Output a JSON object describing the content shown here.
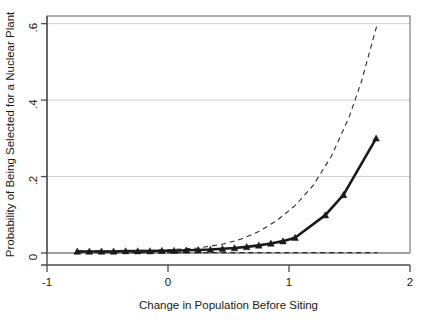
{
  "chart_data": {
    "type": "line",
    "title": "",
    "subtitle": "",
    "xlabel": "Change in Population Before Siting",
    "ylabel": "Probability of Being Selected for a Nuclear Plant",
    "annotation": "N = 188",
    "xlim": [
      -1,
      2
    ],
    "ylim": [
      0,
      0.62
    ],
    "xticks": [
      -1,
      0,
      1,
      2
    ],
    "xtick_labels": [
      "-1",
      "0",
      "1",
      "2"
    ],
    "yticks": [
      0,
      0.2,
      0.4,
      0.6
    ],
    "ytick_labels": [
      "0",
      ".2",
      ".4",
      ".6"
    ],
    "grid": "horizontal",
    "legend": "none",
    "series": [
      {
        "name": "Predicted probability",
        "style": "solid",
        "marker": "triangle",
        "color": "#1a1a1a",
        "width": 2.6,
        "x": [
          -0.75,
          -0.65,
          -0.55,
          -0.45,
          -0.35,
          -0.25,
          -0.15,
          -0.05,
          0.05,
          0.15,
          0.25,
          0.35,
          0.45,
          0.55,
          0.65,
          0.75,
          0.85,
          0.95,
          1.05,
          1.3,
          1.45,
          1.72
        ],
        "values": [
          0.004,
          0.004,
          0.004,
          0.004,
          0.005,
          0.005,
          0.005,
          0.006,
          0.006,
          0.007,
          0.008,
          0.009,
          0.011,
          0.013,
          0.016,
          0.02,
          0.025,
          0.031,
          0.04,
          0.099,
          0.152,
          0.3
        ]
      },
      {
        "name": "Upper 95% confidence bound",
        "style": "dashed",
        "marker": "none",
        "color": "#2b2b2b",
        "width": 1.1,
        "x": [
          -0.75,
          -0.45,
          -0.15,
          0.05,
          0.25,
          0.45,
          0.6,
          0.75,
          0.9,
          1.05,
          1.2,
          1.35,
          1.5,
          1.6,
          1.73
        ],
        "values": [
          0.006,
          0.006,
          0.007,
          0.009,
          0.013,
          0.023,
          0.036,
          0.056,
          0.085,
          0.124,
          0.177,
          0.253,
          0.358,
          0.45,
          0.6
        ]
      },
      {
        "name": "Lower 95% confidence bound",
        "style": "dashed",
        "marker": "none",
        "color": "#2b2b2b",
        "width": 1.1,
        "x": [
          -0.75,
          0,
          0.5,
          1,
          1.4,
          1.73
        ],
        "values": [
          0.001,
          0.001,
          0.001,
          0.001,
          0.001,
          0.001
        ]
      }
    ]
  },
  "axes": {
    "plot_left": 47,
    "plot_right": 410,
    "plot_top": 16,
    "plot_bottom": 253
  }
}
